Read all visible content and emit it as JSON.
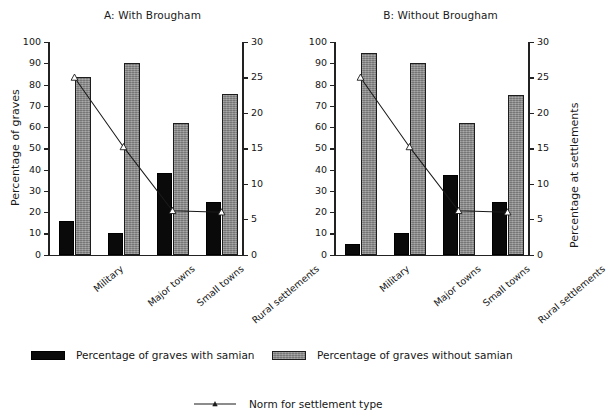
{
  "figure": {
    "background": "#ffffff",
    "series_colors": {
      "with_samian": "#0a0a0a",
      "without_samian": "#8d8d8d",
      "norm_line": "#1a1a1a"
    }
  },
  "panels": [
    {
      "id": "panel-a",
      "title": "A: With Brougham",
      "y_left_label": "Percentage of graves",
      "y_right_label": ""
    },
    {
      "id": "panel-b",
      "title": "B: Without Brougham",
      "y_left_label": "",
      "y_right_label": "Percentage at settlements"
    }
  ],
  "axes": {
    "left_ticks": [
      "0",
      "10",
      "20",
      "30",
      "40",
      "50",
      "60",
      "70",
      "80",
      "90",
      "100"
    ],
    "right_ticks": [
      "0",
      "5",
      "10",
      "15",
      "20",
      "25",
      "30"
    ],
    "left_label": "Percentage of graves",
    "right_label": "Percentage at settlements"
  },
  "legend": {
    "items": [
      {
        "key": "with-samian",
        "label": "Percentage of graves with samian",
        "swatch": "black-rect"
      },
      {
        "key": "without-samian",
        "label": "Percentage of graves without samian",
        "swatch": "grey-rect"
      },
      {
        "key": "norm",
        "label": "Norm for settlement type",
        "swatch": "line-marker"
      }
    ]
  },
  "chart_data": [
    {
      "type": "bar",
      "title": "A: With Brougham",
      "xlabel": "",
      "ylabel": "Percentage of graves",
      "y2label": "Percentage at settlements",
      "categories": [
        "Military",
        "Major towns",
        "Small towns",
        "Rural settlements"
      ],
      "ylim": [
        0,
        100
      ],
      "y2lim": [
        0,
        30
      ],
      "grid": false,
      "legend_position": "bottom",
      "series": [
        {
          "name": "Percentage of graves with samian",
          "type": "bar",
          "axis": "left",
          "color": "#0a0a0a",
          "values": [
            16,
            10,
            38.5,
            25
          ]
        },
        {
          "name": "Percentage of graves without samian",
          "type": "bar",
          "axis": "left",
          "color": "#8d8d8d",
          "values": [
            83.5,
            90,
            62,
            75.5
          ]
        },
        {
          "name": "Norm for settlement type",
          "type": "line",
          "axis": "right",
          "color": "#1a1a1a",
          "marker": "triangle-open",
          "values": [
            25,
            15.2,
            6.2,
            6
          ]
        }
      ]
    },
    {
      "type": "bar",
      "title": "B: Without Brougham",
      "xlabel": "",
      "ylabel": "Percentage of graves",
      "y2label": "Percentage at settlements",
      "categories": [
        "Military",
        "Major towns",
        "Small towns",
        "Rural settlements"
      ],
      "ylim": [
        0,
        100
      ],
      "y2lim": [
        0,
        30
      ],
      "grid": false,
      "legend_position": "bottom",
      "series": [
        {
          "name": "Percentage of graves with samian",
          "type": "bar",
          "axis": "left",
          "color": "#0a0a0a",
          "values": [
            5,
            10,
            37.5,
            25
          ]
        },
        {
          "name": "Percentage of graves without samian",
          "type": "bar",
          "axis": "left",
          "color": "#8d8d8d",
          "values": [
            95,
            90,
            62,
            75
          ]
        },
        {
          "name": "Norm for settlement type",
          "type": "line",
          "axis": "right",
          "color": "#1a1a1a",
          "marker": "triangle-open",
          "values": [
            25,
            15.2,
            6.2,
            6
          ]
        }
      ]
    }
  ]
}
